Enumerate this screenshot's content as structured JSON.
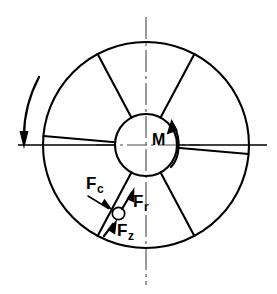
{
  "diagram": {
    "type": "engineering-schematic",
    "background_color": "#ffffff",
    "line_color": "#000000",
    "centerline_color": "#4a4a4a",
    "geometry": {
      "center_x": 146,
      "center_y": 145,
      "outer_radius": 103,
      "hub_radius": 31,
      "spoke_count": 6,
      "spoke_angles_deg": [
        62,
        118,
        175,
        242,
        298,
        355
      ]
    },
    "labels": {
      "moment": {
        "text": "M",
        "sub": "",
        "name": "moment-label"
      },
      "force_c": {
        "text": "F",
        "sub": "c",
        "name": "force-c-label"
      },
      "force_r": {
        "text": "F",
        "sub": "r",
        "name": "force-r-label"
      },
      "force_z": {
        "text": "F",
        "sub": "z",
        "name": "force-z-label"
      }
    },
    "annotations": {
      "rotation_arrow": "clockwise-rotation-arrow",
      "moment_arrow": "moment-curved-arrow",
      "load_point": "load-application-point",
      "vertical_centerline": "vertical-centerline",
      "horizontal_centerline": "horizontal-centerline"
    }
  }
}
